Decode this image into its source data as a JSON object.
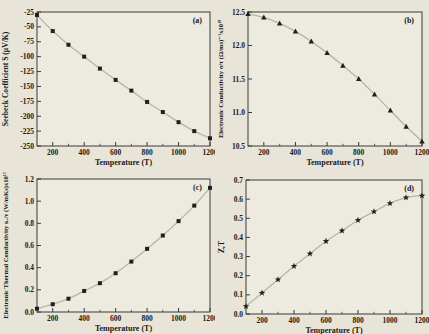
{
  "figure": {
    "panel_labels": [
      "(a)",
      "(b)",
      "(c)",
      "(d)"
    ]
  },
  "colors": {
    "page_bg": "#e8e4d8",
    "plot_bg": "#edeae0",
    "frame": "#3a3a3a",
    "curve": "#b9b4a6",
    "marker": "#1f1f1f",
    "text": "#1a1a1a"
  },
  "chart_data": [
    {
      "id": "a",
      "type": "line",
      "corner_label": "(a)",
      "marker": "square",
      "title": "",
      "xlabel": "Temperature (T)",
      "ylabel": "Seebeck Coefficient S (μV/K)",
      "xlim": [
        100,
        1200
      ],
      "ylim": [
        -250,
        -25
      ],
      "xticks": [
        200,
        400,
        600,
        800,
        1000,
        1200
      ],
      "xtick_labels": [
        "200",
        "400",
        "600",
        "800",
        "1000",
        "1200"
      ],
      "x_minor_step": 100,
      "yticks": [
        -250,
        -225,
        -200,
        -175,
        -150,
        -125,
        -100,
        -75,
        -50,
        -25
      ],
      "ytick_labels": [
        "-250",
        "-225",
        "-200",
        "-175",
        "-150",
        "-125",
        "-100",
        "-75",
        "-50",
        "-25"
      ],
      "x": [
        100,
        200,
        300,
        400,
        500,
        600,
        700,
        800,
        900,
        1000,
        1100,
        1200
      ],
      "y": [
        -30,
        -57,
        -80,
        -100,
        -120,
        -139,
        -157,
        -176,
        -193,
        -210,
        -225,
        -237
      ],
      "grid": false,
      "legend": null
    },
    {
      "id": "b",
      "type": "line",
      "corner_label": "(b)",
      "marker": "triangle",
      "title": "",
      "xlabel": "Temperature (T)",
      "ylabel": "Electronic Conductivity σ/τ (Ω/ms)⁻¹x10¹⁹",
      "xlim": [
        100,
        1200
      ],
      "ylim": [
        10.5,
        12.5
      ],
      "xticks": [
        200,
        400,
        600,
        800,
        1000,
        1200
      ],
      "xtick_labels": [
        "200",
        "400",
        "600",
        "800",
        "1000",
        "1200"
      ],
      "x_minor_step": 100,
      "yticks": [
        10.5,
        11.0,
        11.5,
        12.0,
        12.5
      ],
      "ytick_labels": [
        "10.5",
        "11.0",
        "11.5",
        "12.0",
        "12.5"
      ],
      "x": [
        100,
        200,
        300,
        400,
        500,
        600,
        700,
        800,
        900,
        1000,
        1100,
        1200
      ],
      "y": [
        12.47,
        12.42,
        12.33,
        12.21,
        12.06,
        11.89,
        11.7,
        11.5,
        11.27,
        11.03,
        10.79,
        10.57
      ],
      "grid": false,
      "legend": null
    },
    {
      "id": "c",
      "type": "line",
      "corner_label": "(c)",
      "marker": "square",
      "title": "",
      "xlabel": "Temperature (T)",
      "ylabel": "Electronic Thermal Conductivity κₑ/τ (W/mKs)x10¹⁵",
      "xlim": [
        100,
        1200
      ],
      "ylim": [
        0.0,
        1.2
      ],
      "xticks": [
        200,
        400,
        600,
        800,
        1000,
        1200
      ],
      "xtick_labels": [
        "200",
        "400",
        "600",
        "800",
        "1000",
        "1200"
      ],
      "x_minor_step": 100,
      "yticks": [
        0.0,
        0.2,
        0.4,
        0.6,
        0.8,
        1.0,
        1.2
      ],
      "ytick_labels": [
        "0.0",
        "0.2",
        "0.4",
        "0.6",
        "0.8",
        "1.0",
        "1.2"
      ],
      "x": [
        100,
        200,
        300,
        400,
        500,
        600,
        700,
        800,
        900,
        1000,
        1100,
        1200
      ],
      "y": [
        0.03,
        0.07,
        0.12,
        0.19,
        0.26,
        0.35,
        0.455,
        0.57,
        0.69,
        0.82,
        0.96,
        1.12
      ],
      "grid": false,
      "legend": null
    },
    {
      "id": "d",
      "type": "line",
      "corner_label": "(d)",
      "marker": "star",
      "title": "",
      "xlabel": "Temperature (T)",
      "ylabel": "ZₑT",
      "xlim": [
        100,
        1200
      ],
      "ylim": [
        0.0,
        0.7
      ],
      "xticks": [
        200,
        400,
        600,
        800,
        1000,
        1200
      ],
      "xtick_labels": [
        "200",
        "400",
        "600",
        "800",
        "1000",
        "1200"
      ],
      "x_minor_step": 100,
      "yticks": [
        0.0,
        0.1,
        0.2,
        0.3,
        0.4,
        0.5,
        0.6,
        0.7
      ],
      "ytick_labels": [
        "0.0",
        "0.1",
        "0.2",
        "0.3",
        "0.4",
        "0.5",
        "0.6",
        "0.7"
      ],
      "x": [
        100,
        200,
        300,
        400,
        500,
        600,
        700,
        800,
        900,
        1000,
        1100,
        1200
      ],
      "y": [
        0.04,
        0.11,
        0.18,
        0.25,
        0.315,
        0.38,
        0.435,
        0.49,
        0.535,
        0.578,
        0.608,
        0.618
      ],
      "grid": false,
      "legend": null
    }
  ]
}
